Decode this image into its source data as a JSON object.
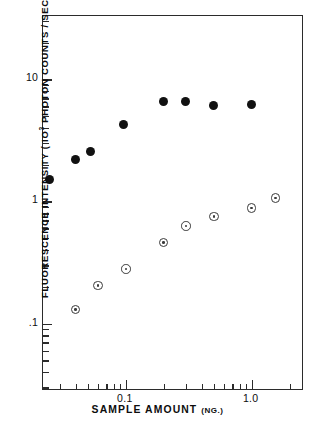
{
  "chart_data": {
    "type": "scatter",
    "title": "",
    "xlabel": "SAMPLE AMOUNT (NG.)",
    "xlabel_main": "SAMPLE  AMOUNT",
    "xlabel_unit": "(NG.)",
    "ylabel": "FLUORESCENCE INTENSITY (10^3 PHOTON COUNTS / SEC.)",
    "ylabel_pre": "FLUORESCENCE  INTENSITY  ( IO",
    "ylabel_sup": "3",
    "ylabel_post": " PHOTON  COUNTS / SEC.)",
    "xscale": "log",
    "yscale": "log",
    "xlim": [
      0.022,
      2.6
    ],
    "ylim": [
      0.028,
      33
    ],
    "grid": false,
    "legend": "none",
    "xticks": [
      {
        "value": 0.1,
        "label": "0.1",
        "major": true
      },
      {
        "value": 1.0,
        "label": "1.0",
        "major": true
      }
    ],
    "xticks_minor": [
      0.03,
      0.04,
      0.05,
      0.06,
      0.07,
      0.08,
      0.09,
      0.2,
      0.3,
      0.4,
      0.5,
      0.6,
      0.7,
      0.8,
      0.9,
      2.0
    ],
    "yticks": [
      {
        "value": 10,
        "label": "10",
        "major": true
      },
      {
        "value": 1,
        "label": "1",
        "major": true
      },
      {
        "value": 0.1,
        "label": ".1",
        "major": true
      }
    ],
    "yticks_minor": [
      0.03,
      0.04,
      0.05,
      0.06,
      0.07,
      0.08,
      0.09,
      0.2,
      0.3,
      0.4,
      0.5,
      0.6,
      0.7,
      0.8,
      0.9,
      2,
      3,
      4,
      5,
      6,
      7,
      8,
      9,
      20,
      30
    ],
    "series": [
      {
        "name": "filled-circles",
        "marker": "filled-circle",
        "color": "#111111",
        "points": [
          {
            "x": 0.025,
            "y": 1.52
          },
          {
            "x": 0.04,
            "y": 2.2
          },
          {
            "x": 0.052,
            "y": 2.55
          },
          {
            "x": 0.095,
            "y": 4.3
          },
          {
            "x": 0.2,
            "y": 6.55
          },
          {
            "x": 0.3,
            "y": 6.6
          },
          {
            "x": 0.5,
            "y": 6.1
          },
          {
            "x": 1.0,
            "y": 6.2
          }
        ]
      },
      {
        "name": "open-circles",
        "marker": "open-circle-dot",
        "color": "#3a3a3a",
        "points": [
          {
            "x": 0.04,
            "y": 0.13
          },
          {
            "x": 0.06,
            "y": 0.205
          },
          {
            "x": 0.1,
            "y": 0.28
          },
          {
            "x": 0.2,
            "y": 0.46
          },
          {
            "x": 0.3,
            "y": 0.63
          },
          {
            "x": 0.5,
            "y": 0.75
          },
          {
            "x": 1.0,
            "y": 0.88
          },
          {
            "x": 1.55,
            "y": 1.07
          }
        ]
      }
    ]
  }
}
